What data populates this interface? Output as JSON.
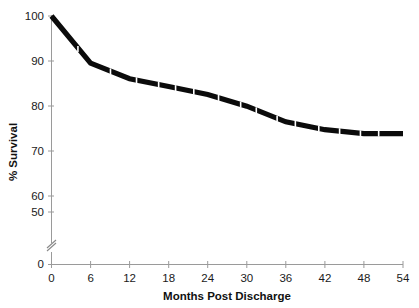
{
  "chart_data": {
    "type": "line",
    "title": "",
    "xlabel": "Months Post Discharge",
    "ylabel": "% Survival",
    "x": [
      0,
      6,
      12,
      18,
      24,
      30,
      36,
      42,
      48,
      54
    ],
    "values": [
      100,
      88,
      84,
      82,
      80,
      77,
      73,
      71,
      70,
      70
    ],
    "series": [
      {
        "name": "Survival",
        "values": [
          100,
          88,
          84,
          82,
          80,
          77,
          73,
          71,
          70,
          70
        ]
      }
    ],
    "xticks": [
      "0",
      "6",
      "12",
      "18",
      "24",
      "30",
      "36",
      "42",
      "48",
      "54"
    ],
    "yticks": [
      "0",
      "50",
      "60",
      "70",
      "80",
      "90",
      "100"
    ],
    "xlim": [
      0,
      54
    ],
    "ylim": [
      0,
      100
    ],
    "y_axis_break": true,
    "y_axis_break_between": [
      0,
      50
    ],
    "grid": false,
    "legend": false,
    "line_color": "#0b0b0b",
    "censoring_marks": [
      4.2,
      9.2,
      13.2,
      16.6,
      19.2,
      22.0,
      25.8,
      29.2,
      31.6,
      34.8,
      37.6,
      41.2,
      44.4,
      47.6,
      50.4
    ]
  },
  "axis": {
    "x_title": "Months Post Discharge",
    "y_title": "% Survival"
  }
}
